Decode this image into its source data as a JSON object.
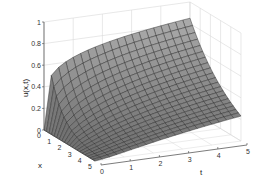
{
  "chart_data": {
    "type": "surface",
    "title": "",
    "xlabel": "x",
    "ylabel": "t",
    "zlabel": "u(x,t)",
    "x_ticks": [
      "0",
      "1",
      "2",
      "3",
      "4",
      "5"
    ],
    "t_ticks": [
      "0",
      "1",
      "2",
      "3",
      "4",
      "5"
    ],
    "z_ticks": [
      "0",
      "0.2",
      "0.4",
      "0.6",
      "0.8",
      "1"
    ],
    "xlim": [
      0,
      5
    ],
    "tlim": [
      0,
      5
    ],
    "zlim": [
      0,
      1
    ],
    "grid": true,
    "surface_color": "#8c8c8c",
    "mesh_color": "#2a2a2a",
    "sample_values": {
      "x": [
        0,
        1,
        2,
        3,
        4,
        5
      ],
      "t": [
        0,
        1,
        2,
        3,
        4,
        5
      ],
      "u_at_x0": [
        0.0,
        0.62,
        0.72,
        0.78,
        0.82,
        0.85
      ],
      "u_at_t5": [
        0.85,
        0.55,
        0.32,
        0.17,
        0.08,
        0.03
      ]
    }
  },
  "axes": {
    "z_label": "u(x,t)",
    "x_label": "x",
    "t_label": "t"
  }
}
